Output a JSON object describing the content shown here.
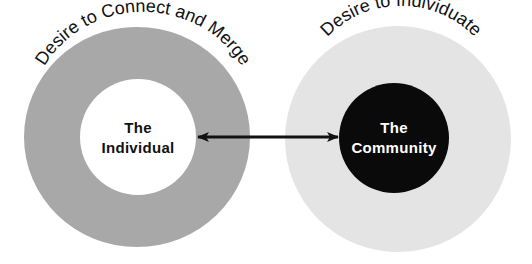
{
  "diagram": {
    "left": {
      "arc_label": "Desire to Connect and Merge",
      "center_line1": "The",
      "center_line2": "Individual",
      "outer_ring_color": "#a8a8a8",
      "inner_circle_color": "#ffffff",
      "center_text_color": "#111111"
    },
    "right": {
      "arc_label": "Desire to Individuate",
      "center_line1": "The",
      "center_line2": "Community",
      "outer_ring_color": "#e4e4e4",
      "inner_circle_color": "#0a0a0a",
      "center_text_color": "#ffffff"
    },
    "connector": {
      "type": "double-headed-arrow",
      "color": "#111111"
    }
  }
}
